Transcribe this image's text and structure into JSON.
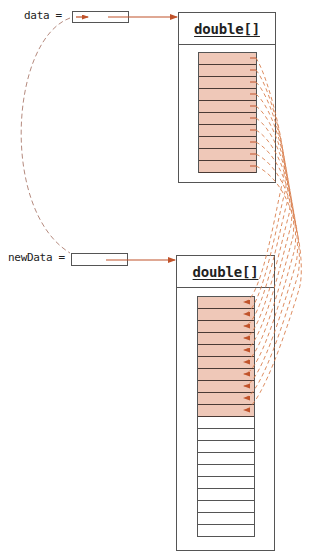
{
  "variables": {
    "data": {
      "label": "data ="
    },
    "newData": {
      "label": "newData ="
    }
  },
  "objects": {
    "old_array": {
      "type_label": "double[]",
      "length": 10,
      "filled": 10
    },
    "new_array": {
      "type_label": "double[]",
      "length": 20,
      "filled": 10
    }
  },
  "colors": {
    "reference_arrow": "#c0532b",
    "copy_arrow": "#d9804f",
    "filled_cell": "#efc8b8",
    "outline": "#555555",
    "reassign_dash": "#b07a6a"
  }
}
